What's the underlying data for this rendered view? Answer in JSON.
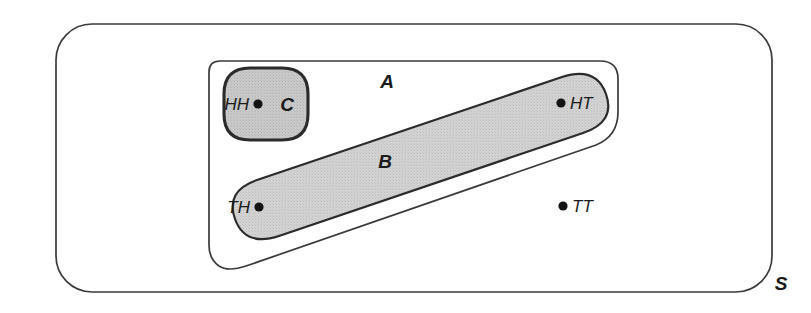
{
  "diagram": {
    "type": "venn-set-diagram",
    "background_color": "#ffffff",
    "line_color": "#2b2b2b",
    "shade_color": "#cfcfcf",
    "shade_color_dark": "#c4c4c4"
  },
  "sets": {
    "universe": {
      "label": "S",
      "name": "sample-space",
      "fill": "#ffffff",
      "shaded": false
    },
    "a": {
      "label": "A",
      "name": "set-a",
      "fill": "#ffffff",
      "shaded": false
    },
    "b": {
      "label": "B",
      "name": "set-b",
      "fill": "#cfcfcf",
      "shaded": true
    },
    "c": {
      "label": "C",
      "name": "set-c",
      "fill": "#c4c4c4",
      "shaded": true
    }
  },
  "points": [
    {
      "label": "HH",
      "name": "outcome-hh",
      "label_side": "left",
      "in_sets": [
        "S",
        "A",
        "C"
      ]
    },
    {
      "label": "HT",
      "name": "outcome-ht",
      "label_side": "right",
      "in_sets": [
        "S",
        "A",
        "B"
      ]
    },
    {
      "label": "TH",
      "name": "outcome-th",
      "label_side": "left",
      "in_sets": [
        "S",
        "A",
        "B"
      ]
    },
    {
      "label": "TT",
      "name": "outcome-tt",
      "label_side": "right",
      "in_sets": [
        "S"
      ]
    }
  ]
}
